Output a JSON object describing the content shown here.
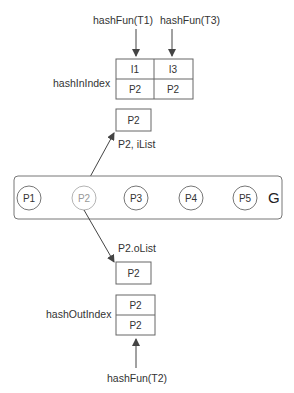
{
  "top_labels": {
    "t1": "hashFun(T1)",
    "t3": "hashFun(T3)"
  },
  "hash_in_index": {
    "label": "hashInIndex",
    "columns": [
      {
        "key": "I1",
        "value": "P2"
      },
      {
        "key": "I3",
        "value": "P2"
      }
    ]
  },
  "ilist": {
    "box": "P2",
    "label": "P2, iList"
  },
  "graph": {
    "label": "G",
    "nodes": [
      "P1",
      "P2",
      "P3",
      "P4",
      "P5"
    ],
    "highlighted": "P2"
  },
  "olist": {
    "label": "P2.oList",
    "box": "P2"
  },
  "hash_out_index": {
    "label": "hashOutIndex",
    "rows": [
      "P2",
      "P2"
    ]
  },
  "bottom_label": {
    "t2": "hashFun(T2)"
  }
}
